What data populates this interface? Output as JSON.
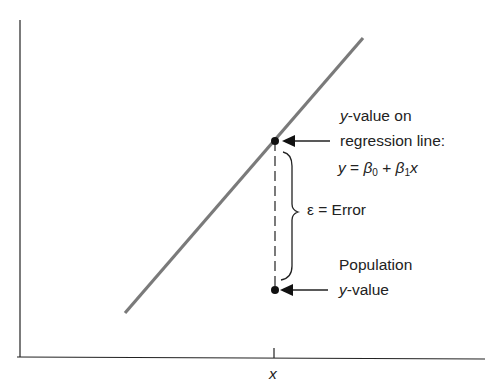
{
  "diagram": {
    "type": "regression-error-illustration",
    "axes": {
      "x_tick_label": "x"
    },
    "regression_line": {
      "color": "#7a7a7a",
      "from": [
        125,
        313
      ],
      "to": [
        363,
        38
      ]
    },
    "points": [
      {
        "name": "regression-point",
        "x": 275,
        "y": 141
      },
      {
        "name": "population-point",
        "x": 275,
        "y": 290
      }
    ],
    "labels": {
      "top_line1_var": "y",
      "top_line1_rest": "-value on",
      "top_line2": "regression line:",
      "equation_y": "y",
      "equation_eq": " = ",
      "equation_b0": "β",
      "equation_b0_sub": "0",
      "equation_plus": " + ",
      "equation_b1": "β",
      "equation_b1_sub": "1",
      "equation_x": "x",
      "error_symbol": "ε",
      "error_text": " = Error",
      "bottom_line1": "Population",
      "bottom_line2_var": "y",
      "bottom_line2_rest": "-value"
    }
  }
}
